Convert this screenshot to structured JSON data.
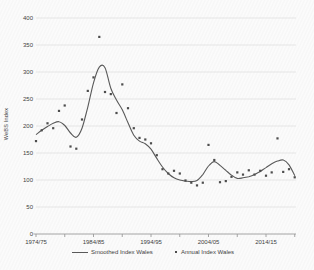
{
  "chart_data": {
    "type": "line",
    "title": "",
    "ylabel": "WeBS Index",
    "ylim": [
      0,
      400
    ],
    "ytick_step": 50,
    "yticks": [
      0,
      50,
      100,
      150,
      200,
      250,
      300,
      350,
      400
    ],
    "x_range_years": [
      1974,
      2019
    ],
    "xtick_minor_every": 5,
    "xtick_major_years": [
      1974,
      1984,
      1994,
      2004,
      2014
    ],
    "xtick_major_labels": [
      "1974/75",
      "1984/85",
      "1994/95",
      "2004/05",
      "2014/15"
    ],
    "grid": "horizontal",
    "legend_position": "bottom",
    "colors": {
      "line": "#595959",
      "points": "#4d4d4d",
      "grid": "#dcdcdc",
      "axis": "#9a9a9a",
      "text": "#3f3f3f"
    },
    "series": [
      {
        "name": "Smoothed Index Wales",
        "type": "line",
        "years": [
          1974,
          1975,
          1976,
          1977,
          1978,
          1979,
          1980,
          1981,
          1982,
          1983,
          1984,
          1985,
          1986,
          1987,
          1988,
          1989,
          1990,
          1991,
          1992,
          1993,
          1994,
          1995,
          1996,
          1997,
          1998,
          1999,
          2000,
          2001,
          2002,
          2003,
          2004,
          2005,
          2006,
          2007,
          2008,
          2009,
          2010,
          2011,
          2012,
          2013,
          2014,
          2015,
          2016,
          2017,
          2018,
          2019
        ],
        "values": [
          184,
          192,
          199,
          205,
          208,
          201,
          187,
          179,
          196,
          235,
          280,
          309,
          308,
          270,
          248,
          230,
          206,
          183,
          172,
          167,
          157,
          140,
          124,
          112,
          104,
          100,
          98,
          97,
          99,
          110,
          126,
          134,
          127,
          118,
          109,
          103,
          104,
          106,
          110,
          116,
          123,
          130,
          135,
          137,
          128,
          108
        ]
      },
      {
        "name": "Annual Index Wales",
        "type": "scatter",
        "years": [
          1974,
          1975,
          1976,
          1977,
          1978,
          1979,
          1980,
          1981,
          1982,
          1983,
          1984,
          1985,
          1986,
          1987,
          1988,
          1989,
          1990,
          1991,
          1992,
          1993,
          1994,
          1995,
          1996,
          1997,
          1998,
          1999,
          2000,
          2001,
          2002,
          2003,
          2004,
          2005,
          2006,
          2007,
          2008,
          2009,
          2010,
          2011,
          2012,
          2013,
          2014,
          2015,
          2016,
          2017,
          2018,
          2019
        ],
        "values": [
          172,
          192,
          205,
          196,
          228,
          238,
          162,
          158,
          212,
          265,
          290,
          365,
          263,
          259,
          224,
          277,
          233,
          196,
          178,
          175,
          168,
          146,
          120,
          112,
          117,
          112,
          99,
          95,
          90,
          95,
          165,
          137,
          96,
          98,
          106,
          114,
          110,
          118,
          110,
          117,
          108,
          114,
          177,
          115,
          120,
          105
        ]
      }
    ]
  }
}
